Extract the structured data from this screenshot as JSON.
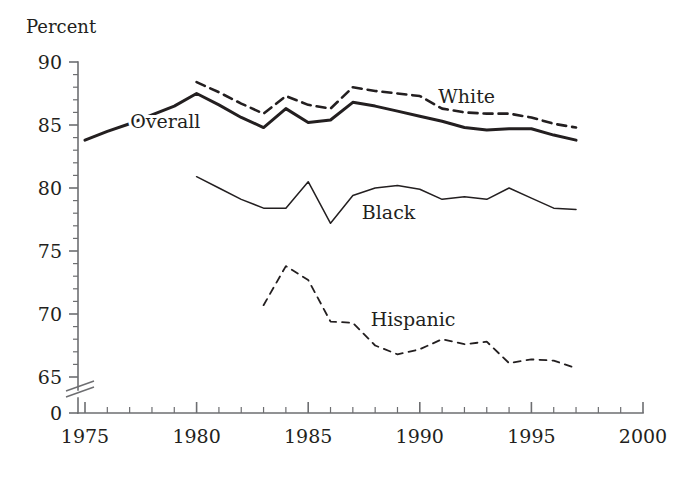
{
  "chart_data": {
    "type": "line",
    "title": "",
    "subtitle": "",
    "ylabel": "Percent",
    "xlabel": "",
    "xlim": [
      1975,
      2000
    ],
    "ylim": [
      64.4,
      90
    ],
    "y_axis_break": true,
    "y_break_bottom_value": 0,
    "grid": false,
    "legend": "inline-annotations",
    "x_ticks_major": [
      "1975",
      "1980",
      "1985",
      "1990",
      "1995",
      "2000"
    ],
    "x_ticks_major_values": [
      1975,
      1980,
      1985,
      1990,
      1995,
      2000
    ],
    "x_tick_minor_step": 1,
    "y_ticks_major": [
      "90",
      "85",
      "80",
      "75",
      "70",
      "65",
      "0"
    ],
    "y_ticks_major_values": [
      90,
      85,
      80,
      75,
      70,
      65
    ],
    "y_zero_label": "0",
    "y_tick_minor_step": 1,
    "series": [
      {
        "name": "Overall",
        "style": "solid-thick",
        "color": "#231f20",
        "label_x": 1978.6,
        "label_y": 85.3,
        "x": [
          1975,
          1976,
          1977,
          1978,
          1979,
          1980,
          1981,
          1982,
          1983,
          1984,
          1985,
          1986,
          1987,
          1988,
          1989,
          1990,
          1991,
          1992,
          1993,
          1994,
          1995,
          1996,
          1997
        ],
        "values": [
          83.8,
          84.5,
          85.1,
          85.8,
          86.5,
          87.5,
          86.6,
          85.6,
          84.8,
          86.3,
          85.2,
          85.4,
          86.8,
          86.5,
          86.1,
          85.7,
          85.3,
          84.8,
          84.6,
          84.7,
          84.7,
          84.2,
          83.8
        ]
      },
      {
        "name": "White",
        "style": "dashed-thick",
        "color": "#231f20",
        "label_x": 1992.1,
        "label_y": 87.3,
        "x": [
          1980,
          1981,
          1982,
          1983,
          1984,
          1985,
          1986,
          1987,
          1988,
          1989,
          1990,
          1991,
          1992,
          1993,
          1994,
          1995,
          1996,
          1997
        ],
        "values": [
          88.4,
          87.6,
          86.7,
          85.9,
          87.3,
          86.6,
          86.3,
          88.0,
          87.7,
          87.5,
          87.3,
          86.3,
          86.0,
          85.9,
          85.9,
          85.6,
          85.1,
          84.8
        ]
      },
      {
        "name": "Black",
        "style": "solid-thin",
        "color": "#58595b",
        "label_x": 1988.6,
        "label_y": 78.1,
        "x": [
          1980,
          1981,
          1982,
          1983,
          1984,
          1985,
          1986,
          1987,
          1988,
          1989,
          1990,
          1991,
          1992,
          1993,
          1994,
          1995,
          1996,
          1997
        ],
        "values": [
          80.9,
          80.0,
          79.1,
          78.4,
          78.4,
          80.5,
          77.2,
          79.4,
          80.0,
          80.2,
          79.9,
          79.1,
          79.3,
          79.1,
          80.0,
          79.2,
          78.4,
          78.3
        ]
      },
      {
        "name": "Hispanic",
        "style": "dashed-thin",
        "color": "#58595b",
        "label_x": 1989.7,
        "label_y": 69.6,
        "x": [
          1983,
          1984,
          1985,
          1986,
          1987,
          1988,
          1989,
          1990,
          1991,
          1992,
          1993,
          1994,
          1995,
          1996,
          1997
        ],
        "values": [
          70.7,
          73.8,
          72.7,
          69.4,
          69.3,
          67.5,
          66.8,
          67.2,
          68.0,
          67.6,
          67.8,
          66.1,
          66.4,
          66.3,
          65.7
        ]
      }
    ]
  },
  "axis": {
    "y_title": "Percent"
  }
}
